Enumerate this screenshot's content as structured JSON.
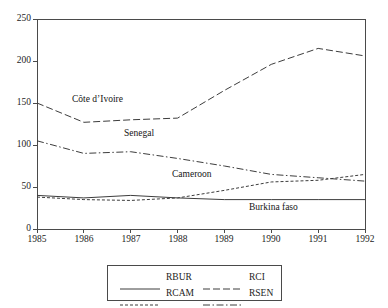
{
  "chart_data": {
    "type": "line",
    "title": "",
    "subtitle": "",
    "xlabel": "",
    "ylabel": "",
    "x": [
      1985,
      1986,
      1987,
      1988,
      1989,
      1990,
      1991,
      1992
    ],
    "xtick_labels": [
      "1985",
      "1986",
      "1987",
      "1988",
      "1989",
      "1990",
      "1991",
      "1992"
    ],
    "ytick_labels": [
      "0",
      "50",
      "100",
      "150",
      "200",
      "250"
    ],
    "yticks": [
      0,
      50,
      100,
      150,
      200,
      250
    ],
    "xlim": [
      1985,
      1992
    ],
    "ylim": [
      0,
      250
    ],
    "grid": false,
    "legend_position": "bottom-center",
    "series": [
      {
        "name": "RBUR",
        "label": "RBUR",
        "annotation": "Burkina faso",
        "style": "solid",
        "color": "#3d3d3d",
        "values": [
          40,
          37,
          40,
          37,
          35,
          35,
          35,
          35
        ]
      },
      {
        "name": "RCI",
        "label": "RCI",
        "annotation": "Côte d’Ivoire",
        "style": "dashed",
        "color": "#3d3d3d",
        "values": [
          150,
          127,
          130,
          132,
          165,
          196,
          215,
          206
        ]
      },
      {
        "name": "RCAM",
        "label": "RCAM",
        "annotation": "Cameroon",
        "style": "dotted",
        "color": "#3d3d3d",
        "values": [
          38,
          35,
          34,
          37,
          46,
          56,
          58,
          65
        ]
      },
      {
        "name": "RSEN",
        "label": "RSEN",
        "annotation": "Senegal",
        "style": "dashdot",
        "color": "#3d3d3d",
        "values": [
          105,
          90,
          92,
          84,
          75,
          65,
          61,
          57
        ]
      }
    ],
    "annotations": [
      {
        "text": "Côte d’Ivoire",
        "x": 72,
        "y": 95
      },
      {
        "text": "Senegal",
        "x": 124,
        "y": 129
      },
      {
        "text": "Cameroon",
        "x": 172,
        "y": 170
      },
      {
        "text": "Burkina faso",
        "x": 249,
        "y": 203
      }
    ]
  },
  "axes": {
    "y_ticks": [
      {
        "label": "250",
        "left": 5,
        "top": 14
      },
      {
        "label": "200",
        "left": 5,
        "top": 56
      },
      {
        "label": "150",
        "left": 5,
        "top": 98
      },
      {
        "label": "100",
        "left": 5,
        "top": 140
      },
      {
        "label": "50",
        "left": 5,
        "top": 182
      },
      {
        "label": "0",
        "left": 5,
        "top": 224
      }
    ],
    "x_ticks": [
      {
        "label": "1985",
        "left": 17,
        "top": 235
      },
      {
        "label": "1986",
        "left": 64,
        "top": 235
      },
      {
        "label": "1987",
        "left": 111,
        "top": 235
      },
      {
        "label": "1988",
        "left": 158,
        "top": 235
      },
      {
        "label": "1989",
        "left": 204,
        "top": 235
      },
      {
        "label": "1990",
        "left": 251,
        "top": 235
      },
      {
        "label": "1991",
        "left": 298,
        "top": 235
      },
      {
        "label": "1992",
        "left": 345,
        "top": 235
      }
    ]
  },
  "legend": {
    "entries": [
      {
        "label": "RBUR",
        "style": "solid",
        "left": 12,
        "top": 3
      },
      {
        "label": "RCI",
        "style": "dashed",
        "left": 95,
        "top": 3
      },
      {
        "label": "RCAM",
        "style": "dotted",
        "left": 12,
        "top": 19
      },
      {
        "label": "RSEN",
        "style": "dashdot",
        "left": 95,
        "top": 19
      }
    ]
  }
}
